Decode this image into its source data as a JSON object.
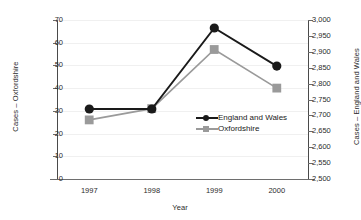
{
  "chart_data": {
    "type": "line",
    "title": "",
    "xlabel": "Year",
    "categories": [
      "1997",
      "1998",
      "1999",
      "2000"
    ],
    "x": [
      1997,
      1998,
      1999,
      2000
    ],
    "grid": true,
    "legend_position": "center-right-inside",
    "axes": {
      "left": {
        "label": "Cases – Oxfordshire",
        "ylim": [
          0,
          70
        ],
        "tick_step": 10,
        "ticks": [
          0,
          10,
          20,
          30,
          40,
          50,
          60,
          70
        ],
        "tick_labels": [
          "0",
          "10",
          "20",
          "30",
          "40",
          "50",
          "60",
          "70"
        ]
      },
      "right": {
        "label": "Cases – England and Wales",
        "ylim": [
          2500,
          3000
        ],
        "tick_step": 50,
        "ticks": [
          2500,
          2550,
          2600,
          2650,
          2700,
          2750,
          2800,
          2850,
          2900,
          2950,
          3000
        ],
        "tick_labels": [
          "2,500",
          "2,550",
          "2,600",
          "2,650",
          "2,700",
          "2,750",
          "2,800",
          "2,850",
          "2,900",
          "2,950",
          "3,000"
        ]
      }
    },
    "series": [
      {
        "name": "England and Wales",
        "axis": "right",
        "color": "#1a1a1a",
        "marker": "circle",
        "values": [
          2720,
          2720,
          2975,
          2855
        ]
      },
      {
        "name": "Oxfordshire",
        "axis": "left",
        "color": "#9a9a9a",
        "marker": "square",
        "values": [
          26,
          31,
          57,
          40
        ]
      }
    ]
  },
  "legend": {
    "items": [
      {
        "label": "England and Wales",
        "color": "#1a1a1a",
        "marker": "circle"
      },
      {
        "label": "Oxfordshire",
        "color": "#9a9a9a",
        "marker": "square"
      }
    ]
  },
  "colors": {
    "series_england_wales": "#1a1a1a",
    "series_oxfordshire": "#9a9a9a",
    "axis": "#4a4a4a",
    "grid": "#f0f0f0",
    "background": "#ffffff"
  }
}
